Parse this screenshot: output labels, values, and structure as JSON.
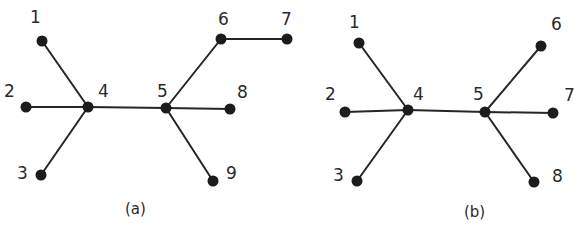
{
  "colors": {
    "edge": "#262626",
    "node": "#1c1c1c",
    "text": "#2a2a2a",
    "background": "#ffffff"
  },
  "graphs": [
    {
      "caption": "(a)",
      "caption_pos": [
        125,
        214
      ],
      "nodes": [
        {
          "id": "1",
          "x": 42,
          "y": 41,
          "lx": 30,
          "ly": 23
        },
        {
          "id": "2",
          "x": 26,
          "y": 107,
          "lx": 4,
          "ly": 97
        },
        {
          "id": "3",
          "x": 41,
          "y": 175,
          "lx": 17,
          "ly": 179
        },
        {
          "id": "4",
          "x": 88,
          "y": 107,
          "lx": 98,
          "ly": 97
        },
        {
          "id": "5",
          "x": 166,
          "y": 108,
          "lx": 157,
          "ly": 97
        },
        {
          "id": "6",
          "x": 221,
          "y": 39,
          "lx": 218,
          "ly": 25
        },
        {
          "id": "7",
          "x": 287,
          "y": 39,
          "lx": 281,
          "ly": 25
        },
        {
          "id": "8",
          "x": 230,
          "y": 109,
          "lx": 237,
          "ly": 98
        },
        {
          "id": "9",
          "x": 213,
          "y": 181,
          "lx": 226,
          "ly": 179
        }
      ],
      "edges": [
        [
          "1",
          "4"
        ],
        [
          "2",
          "4"
        ],
        [
          "3",
          "4"
        ],
        [
          "4",
          "5"
        ],
        [
          "5",
          "6"
        ],
        [
          "6",
          "7"
        ],
        [
          "5",
          "8"
        ],
        [
          "5",
          "9"
        ]
      ]
    },
    {
      "caption": "(b)",
      "caption_pos": [
        464,
        217
      ],
      "nodes": [
        {
          "id": "1",
          "x": 359,
          "y": 43,
          "lx": 349,
          "ly": 28
        },
        {
          "id": "2",
          "x": 345,
          "y": 112,
          "lx": 325,
          "ly": 100
        },
        {
          "id": "3",
          "x": 357,
          "y": 181,
          "lx": 333,
          "ly": 181
        },
        {
          "id": "4",
          "x": 408,
          "y": 110,
          "lx": 413,
          "ly": 100
        },
        {
          "id": "5",
          "x": 485,
          "y": 112,
          "lx": 473,
          "ly": 100
        },
        {
          "id": "6",
          "x": 541,
          "y": 46,
          "lx": 551,
          "ly": 30
        },
        {
          "id": "7",
          "x": 553,
          "y": 113,
          "lx": 564,
          "ly": 101
        },
        {
          "id": "8",
          "x": 534,
          "y": 182,
          "lx": 552,
          "ly": 182
        }
      ],
      "edges": [
        [
          "1",
          "4"
        ],
        [
          "2",
          "4"
        ],
        [
          "3",
          "4"
        ],
        [
          "4",
          "5"
        ],
        [
          "5",
          "6"
        ],
        [
          "5",
          "7"
        ],
        [
          "5",
          "8"
        ]
      ]
    }
  ]
}
